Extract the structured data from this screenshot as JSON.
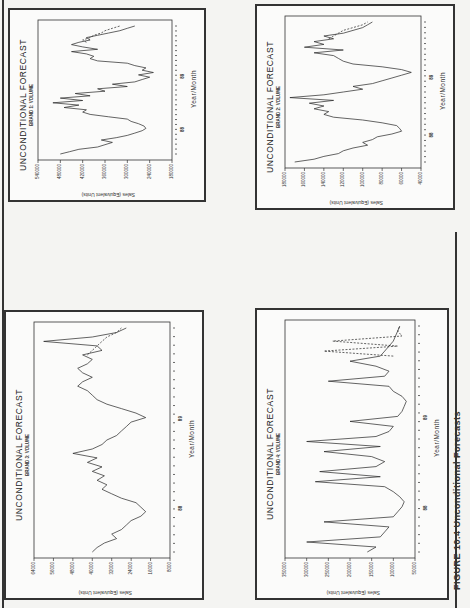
{
  "page": {
    "caption": "FIGURE 10.4   Unconditional Forecasts",
    "colors": {
      "ink": "#222222",
      "paper": "#f4f4f2",
      "frame": "#333333"
    }
  },
  "common": {
    "title": "UNCONDITIONAL FORECAST",
    "xlabel": "Year/Month",
    "ylabel": "Sales (Equivalent Units)",
    "year_marks": [
      "88",
      "89"
    ]
  },
  "charts": [
    {
      "id": "brand1",
      "subtitle": "BRAND 1: VOLUME",
      "yticks": [
        "540000",
        "480000",
        "420000",
        "360000",
        "300000",
        "240000",
        "180000"
      ]
    },
    {
      "id": "brand2",
      "subtitle": "BRAND 2: VOLUME",
      "yticks": [
        "180000",
        "160000",
        "140000",
        "120000",
        "100000",
        "80000",
        "60000",
        "40000"
      ]
    },
    {
      "id": "brand3",
      "subtitle": "BRAND 3: VOLUME",
      "yticks": [
        "64000",
        "56000",
        "48000",
        "40000",
        "32000",
        "24000",
        "16000",
        "8000"
      ]
    },
    {
      "id": "brand4",
      "subtitle": "BRAND 4: VOLUME",
      "yticks": [
        "350000",
        "300000",
        "250000",
        "200000",
        "150000",
        "100000",
        "50000"
      ]
    }
  ],
  "chart_data": [
    {
      "type": "line",
      "title": "UNCONDITIONAL FORECAST",
      "subtitle": "BRAND 1: VOLUME",
      "xlabel": "Year/Month",
      "ylabel": "Sales (Equivalent Units)",
      "ylim": [
        180000,
        540000
      ],
      "yticks": [
        540000,
        480000,
        420000,
        360000,
        300000,
        240000,
        180000
      ],
      "x_year_marks": [
        "88",
        "89"
      ],
      "series": [
        {
          "name": "actual",
          "style": "solid",
          "values": [
            480000,
            455000,
            430000,
            380000,
            360000,
            340000,
            370000,
            330000,
            300000,
            280000,
            260000,
            250000,
            255000,
            270000,
            290000,
            300000,
            350000,
            400000,
            420000,
            410000,
            470000,
            430000,
            500000,
            420000,
            480000,
            400000,
            440000,
            360000,
            380000,
            300000,
            340000,
            280000,
            260000,
            240000,
            270000,
            230000,
            260000,
            250000,
            280000,
            300000,
            380000,
            400000,
            390000,
            410000,
            450000,
            380000,
            420000,
            450000,
            430000,
            400000,
            410000,
            380000,
            350000,
            320000,
            300000,
            280000
          ]
        },
        {
          "name": "forecast",
          "style": "dashed",
          "values": [
            410000,
            420000,
            400000,
            390000,
            370000,
            360000,
            340000,
            320000
          ]
        }
      ],
      "grid": false
    },
    {
      "type": "line",
      "title": "UNCONDITIONAL FORECAST",
      "subtitle": "BRAND 2: VOLUME",
      "xlabel": "Year/Month",
      "ylabel": "Sales (Equivalent Units)",
      "ylim": [
        40000,
        180000
      ],
      "yticks": [
        180000,
        160000,
        140000,
        120000,
        100000,
        80000,
        60000,
        40000
      ],
      "x_year_marks": [
        "88",
        "89"
      ],
      "series": [
        {
          "name": "actual",
          "style": "solid",
          "values": [
            170000,
            150000,
            140000,
            125000,
            120000,
            110000,
            95000,
            100000,
            90000,
            85000,
            70000,
            60000,
            62000,
            65000,
            80000,
            100000,
            130000,
            140000,
            135000,
            150000,
            140000,
            155000,
            130000,
            175000,
            140000,
            120000,
            100000,
            110000,
            90000,
            80000,
            70000,
            60000,
            50000,
            60000,
            80000,
            110000,
            120000,
            125000,
            130000,
            150000,
            120000,
            160000,
            140000,
            150000,
            130000,
            140000,
            120000,
            110000,
            100000,
            95000,
            90000
          ]
        },
        {
          "name": "forecast",
          "style": "dashed",
          "values": [
            135000,
            130000,
            125000,
            120000,
            110000,
            100000,
            95000
          ]
        }
      ],
      "grid": false
    },
    {
      "type": "line",
      "title": "UNCONDITIONAL FORECAST",
      "subtitle": "BRAND 3: VOLUME",
      "xlabel": "Year/Month",
      "ylabel": "Sales (Equivalent Units)",
      "ylim": [
        8000,
        64000
      ],
      "yticks": [
        64000,
        56000,
        48000,
        40000,
        32000,
        24000,
        16000,
        8000
      ],
      "x_year_marks": [
        "88",
        "89"
      ],
      "series": [
        {
          "name": "actual",
          "style": "solid",
          "values": [
            40000,
            38000,
            35000,
            30000,
            32000,
            28000,
            26000,
            24000,
            20000,
            18000,
            20000,
            22000,
            28000,
            32000,
            36000,
            34000,
            38000,
            35000,
            40000,
            36000,
            42000,
            38000,
            48000,
            40000,
            36000,
            34000,
            30000,
            28000,
            26000,
            24000,
            18000,
            22000,
            28000,
            34000,
            38000,
            40000,
            42000,
            46000,
            44000,
            40000,
            44000,
            46000,
            42000,
            40000,
            44000,
            36000,
            38000,
            60000,
            40000,
            30000,
            26000
          ]
        },
        {
          "name": "forecast",
          "style": "dashed",
          "values": [
            42000,
            40000,
            38000,
            36000,
            34000,
            30000,
            28000
          ]
        }
      ],
      "grid": false
    },
    {
      "type": "line",
      "title": "UNCONDITIONAL FORECAST",
      "subtitle": "BRAND 4: VOLUME",
      "xlabel": "Year/Month",
      "ylabel": "Sales (Equivalent Units)",
      "ylim": [
        50000,
        350000
      ],
      "yticks": [
        350000,
        300000,
        250000,
        200000,
        150000,
        100000,
        50000
      ],
      "x_year_marks": [
        "88",
        "89"
      ],
      "series": [
        {
          "name": "actual",
          "style": "solid",
          "values": [
            160000,
            140000,
            300000,
            130000,
            120000,
            110000,
            260000,
            100000,
            90000,
            80000,
            75000,
            85000,
            100000,
            120000,
            280000,
            130000,
            270000,
            140000,
            120000,
            150000,
            260000,
            130000,
            300000,
            140000,
            110000,
            100000,
            200000,
            90000,
            80000,
            75000,
            70000,
            80000,
            100000,
            110000,
            250000,
            120000,
            110000,
            140000,
            200000,
            130000,
            120000,
            110000,
            100000,
            95000,
            90000,
            85000
          ]
        },
        {
          "name": "forecast",
          "style": "dashed",
          "values": [
            100000,
            260000,
            90000,
            240000,
            80000,
            90000,
            85000
          ]
        }
      ],
      "grid": false
    }
  ]
}
